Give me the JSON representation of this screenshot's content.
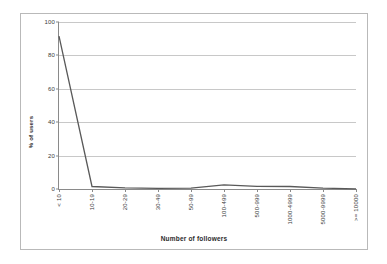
{
  "chart_data": {
    "type": "line",
    "title": "",
    "xlabel": "Number of followers",
    "ylabel": "% of users",
    "categories": [
      "< 10",
      "10-19",
      "20-29",
      "30-49",
      "50-99",
      "100-499",
      "500-999",
      "1000-4999",
      "5000-9999",
      ">= 10000"
    ],
    "values": [
      91.5,
      1.5,
      0.7,
      0.4,
      0.5,
      2.5,
      1.6,
      1.5,
      0.5,
      0.1
    ],
    "series": [
      {
        "name": "% of users",
        "values": [
          91.5,
          1.5,
          0.7,
          0.4,
          0.5,
          2.5,
          1.6,
          1.5,
          0.5,
          0.1
        ]
      }
    ],
    "ylim": [
      0,
      100
    ],
    "yticks": [
      0,
      20,
      40,
      60,
      80,
      100
    ],
    "ytick_labels": [
      "0",
      "20",
      "40",
      "60",
      "80",
      "100"
    ],
    "grid": "horizontal",
    "legend": "none",
    "line_color": "#595959",
    "grid_color": "#c8c8c8",
    "axis_color": "#8a8a8a",
    "border_color": "#b9b9b9"
  }
}
